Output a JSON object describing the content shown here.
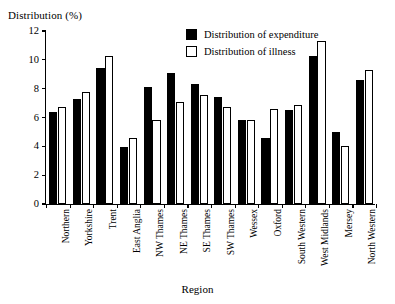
{
  "chart_data": {
    "type": "bar",
    "title": "",
    "xlabel": "Region",
    "ylabel": "Distribution (%)",
    "ylim": [
      0,
      12
    ],
    "yticks": [
      "0",
      "2",
      "4",
      "6",
      "8",
      "10",
      "12"
    ],
    "ytick_values": [
      0,
      2,
      4,
      6,
      8,
      10,
      12
    ],
    "grid": false,
    "legend_position": "top-right",
    "categories": [
      "Northern",
      "Yorkshire",
      "Trent",
      "East Anglia",
      "NW Thames",
      "NE Thames",
      "SE Thames",
      "SW Thames",
      "Wessex",
      "Oxford",
      "South Western",
      "West Midlands",
      "Mersey",
      "North Western"
    ],
    "series": [
      {
        "name": "Distribution of expenditure",
        "color": "#000000",
        "values": [
          6.35,
          7.3,
          9.4,
          3.95,
          8.1,
          9.1,
          8.35,
          7.4,
          5.8,
          4.55,
          6.5,
          10.3,
          5.0,
          8.6
        ]
      },
      {
        "name": "Distribution of illness",
        "color": "#ffffff",
        "values": [
          6.7,
          7.75,
          10.25,
          4.55,
          5.8,
          7.1,
          7.55,
          6.75,
          5.8,
          6.6,
          6.9,
          11.3,
          4.05,
          9.3
        ]
      }
    ]
  },
  "legend": {
    "items": [
      {
        "label": "Distribution of expenditure",
        "swatch": "filled-black-square"
      },
      {
        "label": "Distribution of illness",
        "swatch": "open-white-square"
      }
    ]
  }
}
